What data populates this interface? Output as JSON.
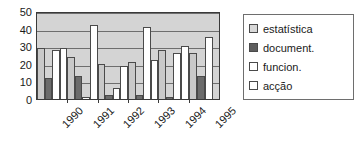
{
  "chart_data": {
    "type": "bar",
    "title": "",
    "subtitle": "",
    "xlabel": "",
    "ylabel": "",
    "categories": [
      "1990",
      "1991",
      "1992",
      "1993",
      "1994",
      "1995"
    ],
    "ylim": [
      0,
      50
    ],
    "yticks": [
      0,
      10,
      20,
      30,
      40,
      50
    ],
    "ytick_labels": [
      "0",
      "10",
      "20",
      "30",
      "40",
      "50"
    ],
    "grid": true,
    "grid_axis": "y",
    "legend_position": "right",
    "series": [
      {
        "name": "estatística",
        "color": "#c9c9c9",
        "values": [
          29,
          24,
          20,
          21,
          28,
          26
        ]
      },
      {
        "name": "document.",
        "color": "#6b6b6b",
        "values": [
          12,
          13,
          2,
          2,
          1,
          13
        ]
      },
      {
        "name": "funcion.",
        "color": "#ffffff",
        "values": [
          28,
          1,
          6,
          41,
          26,
          35
        ]
      },
      {
        "name": "acção",
        "color": "#ffffff",
        "values": [
          29,
          42,
          19,
          22,
          30,
          null
        ]
      }
    ]
  },
  "legend": {
    "items": [
      {
        "label": "estatística"
      },
      {
        "label": "document."
      },
      {
        "label": "funcion."
      },
      {
        "label": "acção"
      }
    ]
  },
  "axes": {
    "y_labels": [
      "50",
      "40",
      "30",
      "20",
      "10",
      "0"
    ],
    "x_labels": [
      "1990",
      "1991",
      "1992",
      "1993",
      "1994",
      "1995"
    ]
  },
  "colors": {
    "plot_background": "#d4d4d4",
    "axis_line": "#3a3a3a",
    "gridline": "#6e6e6e",
    "text": "#1a1a1a",
    "page_background": "#ffffff"
  }
}
